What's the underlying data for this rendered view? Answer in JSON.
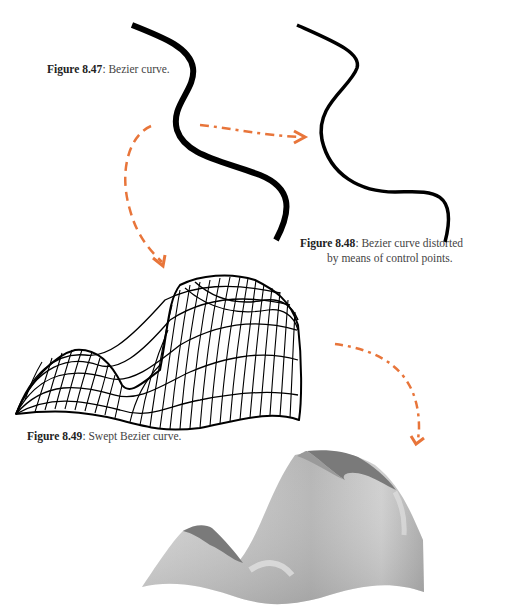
{
  "figures": [
    {
      "id": "fig-8-47",
      "label": "Figure 8.47",
      "caption": ": Bezier curve."
    },
    {
      "id": "fig-8-48",
      "label": "Figure 8.48",
      "caption_line1": ": Bezier curve distorted",
      "caption_line2": "by means of control points."
    },
    {
      "id": "fig-8-49",
      "label": "Figure 8.49",
      "caption": ": Swept Bezier curve."
    }
  ],
  "colors": {
    "curve": "#000000",
    "arrow": "#e8753a",
    "surface_light": "#c8c8c8",
    "surface_dark": "#777777",
    "background": "#ffffff"
  },
  "icons": {
    "arrow_1": "dashed-arrow-right",
    "arrow_2": "dashed-arrow-down",
    "arrow_3": "dashed-arrow-down"
  }
}
